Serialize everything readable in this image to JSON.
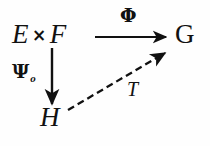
{
  "diagram": {
    "type": "commutative-diagram",
    "width": 210,
    "height": 146,
    "background_color": "#fefefe",
    "ink_color": "#111111",
    "nodes": [
      {
        "id": "source",
        "text_left": "E",
        "text_op": "×",
        "text_right": "F",
        "full_text": "E × F",
        "x": 48,
        "y": 36
      },
      {
        "id": "target",
        "full_text": "G",
        "x": 184,
        "y": 36
      },
      {
        "id": "factor",
        "full_text": "H",
        "x": 50,
        "y": 119
      }
    ],
    "arrows": [
      {
        "id": "phi-arrow",
        "label": "Φ",
        "from": "source",
        "to": "target",
        "style": "solid",
        "x1": 95,
        "y1": 37,
        "x2": 168,
        "y2": 37
      },
      {
        "id": "psi-arrow",
        "label": "Ψ",
        "label_subscript": "o",
        "from": "source",
        "to": "factor",
        "style": "solid",
        "x1": 52,
        "y1": 48,
        "x2": 52,
        "y2": 106
      },
      {
        "id": "t-arrow",
        "label": "T",
        "from": "factor",
        "to": "target",
        "style": "dashed",
        "dash": "7 4",
        "x1": 68,
        "y1": 110,
        "x2": 167,
        "y2": 51
      }
    ]
  },
  "labels": {
    "source_left": "E",
    "source_times": "×",
    "source_right": "F",
    "target": "G",
    "factor": "H",
    "phi": "Φ",
    "psi": "Ψ",
    "psi_subscript": "o",
    "t": "T"
  }
}
